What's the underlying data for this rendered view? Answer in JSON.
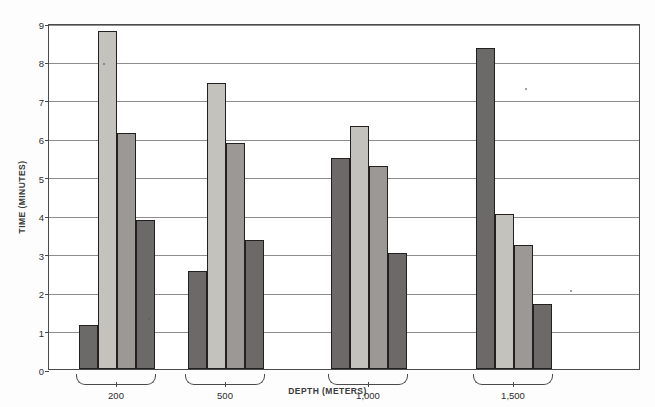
{
  "chart_data": {
    "type": "bar",
    "title": "",
    "xlabel": "DEPTH (METERS)",
    "ylabel": "TIME (MINUTES)",
    "categories": [
      "200",
      "500",
      "1,000",
      "1,500"
    ],
    "ylim": [
      0,
      9
    ],
    "yticks": [
      "0",
      "1",
      "2",
      "3",
      "4",
      "5",
      "6",
      "7",
      "8",
      "9"
    ],
    "grid": true,
    "legend_position": "none",
    "series": [
      {
        "name": "series-1",
        "shade": "dark",
        "values": [
          1.15,
          2.55,
          5.48,
          8.35
        ]
      },
      {
        "name": "series-2",
        "shade": "light",
        "values": [
          8.78,
          7.45,
          6.32,
          4.02
        ]
      },
      {
        "name": "series-3",
        "shade": "mid",
        "values": [
          6.13,
          5.88,
          5.27,
          3.22
        ]
      },
      {
        "name": "series-4",
        "shade": "dark",
        "values": [
          3.87,
          3.35,
          3.03,
          1.7
        ]
      }
    ],
    "colors": {
      "dark": "#6c6a68",
      "light": "#c3c2bd",
      "mid": "#9a9996",
      "axis": "#4a4a4a",
      "grid": "#8d8d8d",
      "text": "#2c2c2c",
      "background": "#ffffff"
    }
  }
}
